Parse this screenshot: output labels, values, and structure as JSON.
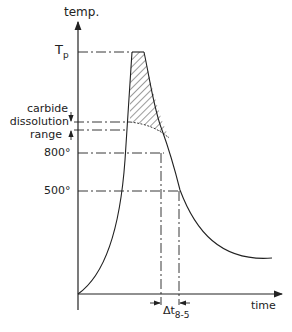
{
  "diagram": {
    "y_axis_label": "temp.",
    "x_axis_label": "time",
    "peak_label_main": "T",
    "peak_label_sub": "p",
    "carbide_label_lines": [
      "carbide",
      "dissolution",
      "range"
    ],
    "temp_800_label": "800°",
    "temp_500_label": "500°",
    "delta_t_main": "Δt",
    "delta_t_sub": "8-5"
  },
  "colors": {
    "line": "#222222",
    "background": "#ffffff"
  }
}
